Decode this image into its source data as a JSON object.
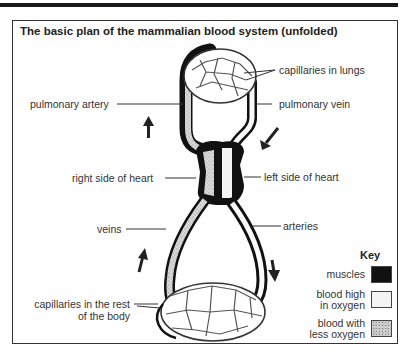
{
  "title": "The basic plan of the mammalian blood system (unfolded)",
  "labels": {
    "capillaries_in_lungs": "capillaries in lungs",
    "pulmonary_artery": "pulmonary artery",
    "pulmonary_vein": "pulmonary vein",
    "right_side_of_heart": "right side of heart",
    "left_side_of_heart": "left side of heart",
    "veins": "veins",
    "arteries": "arteries",
    "capillaries_body_line1": "capillaries in the rest",
    "capillaries_body_line2": "of the body"
  },
  "key": {
    "title": "Key",
    "items": [
      {
        "line1": "muscles",
        "line2": "",
        "color": "#111111"
      },
      {
        "line1": "blood high",
        "line2": "in oxygen",
        "color": "#f4f4f4"
      },
      {
        "line1": "blood with",
        "line2": "less oxygen",
        "color": "#cfcfcf"
      }
    ]
  },
  "flow_arrows": [
    "up-left-pulmonary-artery",
    "down-right-pulmonary-vein",
    "up-veins",
    "down-arteries"
  ]
}
